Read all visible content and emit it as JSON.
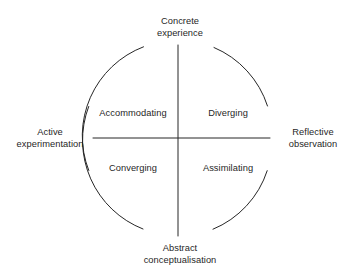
{
  "diagram": {
    "type": "quadrant-circle",
    "background_color": "#ffffff",
    "line_color": "#262626",
    "text_color": "#1f1f1f",
    "geometry": {
      "center_x": 178,
      "center_y": 138,
      "radius": 95,
      "vertical_axis_top_y": 45,
      "vertical_axis_bottom_y": 236,
      "horizontal_axis_left_x": 93,
      "horizontal_axis_right_x": 270
    },
    "poles": {
      "top": {
        "name": "concrete-experience",
        "line1": "Concrete",
        "line2": "experience"
      },
      "bottom": {
        "name": "abstract-conceptualisation",
        "line1": "Abstract",
        "line2": "conceptualisation"
      },
      "left": {
        "name": "active-experimentation",
        "line1": "Active",
        "line2": "experimentation"
      },
      "right": {
        "name": "reflective-observation",
        "line1": "Reflective",
        "line2": "observation"
      }
    },
    "quadrants": {
      "top_left": "Accommodating",
      "top_right": "Diverging",
      "bottom_left": "Converging",
      "bottom_right": "Assimilating"
    }
  }
}
